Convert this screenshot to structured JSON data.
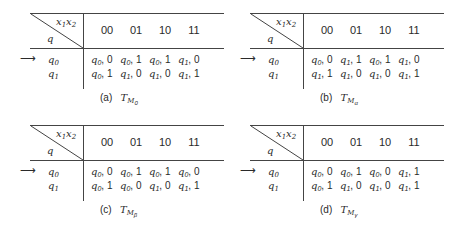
{
  "header": {
    "x_label": "x",
    "x1_sub": "1",
    "x2_sub": "2",
    "q_label": "q"
  },
  "columns": [
    "00",
    "01",
    "10",
    "11"
  ],
  "row_labels": [
    {
      "sym": "q",
      "sub": "0"
    },
    {
      "sym": "q",
      "sub": "1"
    }
  ],
  "start_arrow": "⟶",
  "tables": [
    {
      "caption_letter": "(a)",
      "caption_T": "T",
      "caption_sub": "M",
      "caption_subsub": "0",
      "rows": [
        [
          {
            "q": "0",
            "o": "0"
          },
          {
            "q": "0",
            "o": "1"
          },
          {
            "q": "0",
            "o": "1"
          },
          {
            "q": "1",
            "o": "0"
          }
        ],
        [
          {
            "q": "0",
            "o": "1"
          },
          {
            "q": "1",
            "o": "0"
          },
          {
            "q": "1",
            "o": "0"
          },
          {
            "q": "1",
            "o": "1"
          }
        ]
      ]
    },
    {
      "caption_letter": "(b)",
      "caption_T": "T",
      "caption_sub": "M",
      "caption_subsub": "α",
      "rows": [
        [
          {
            "q": "0",
            "o": "0"
          },
          {
            "q": "1",
            "o": "1"
          },
          {
            "q": "0",
            "o": "1"
          },
          {
            "q": "1",
            "o": "0"
          }
        ],
        [
          {
            "q": "1",
            "o": "1"
          },
          {
            "q": "1",
            "o": "0"
          },
          {
            "q": "1",
            "o": "0"
          },
          {
            "q": "1",
            "o": "1"
          }
        ]
      ]
    },
    {
      "caption_letter": "(c)",
      "caption_T": "T",
      "caption_sub": "M",
      "caption_subsub": "β",
      "rows": [
        [
          {
            "q": "0",
            "o": "0"
          },
          {
            "q": "0",
            "o": "1"
          },
          {
            "q": "0",
            "o": "1"
          },
          {
            "q": "0",
            "o": "0"
          }
        ],
        [
          {
            "q": "0",
            "o": "1"
          },
          {
            "q": "0",
            "o": "0"
          },
          {
            "q": "1",
            "o": "0"
          },
          {
            "q": "1",
            "o": "1"
          }
        ]
      ]
    },
    {
      "caption_letter": "(d)",
      "caption_T": "T",
      "caption_sub": "M",
      "caption_subsub": "γ",
      "rows": [
        [
          {
            "q": "0",
            "o": "0"
          },
          {
            "q": "0",
            "o": "1"
          },
          {
            "q": "0",
            "o": "0"
          },
          {
            "q": "1",
            "o": "1"
          }
        ],
        [
          {
            "q": "0",
            "o": "1"
          },
          {
            "q": "1",
            "o": "0"
          },
          {
            "q": "1",
            "o": "0"
          },
          {
            "q": "1",
            "o": "1"
          }
        ]
      ]
    }
  ]
}
